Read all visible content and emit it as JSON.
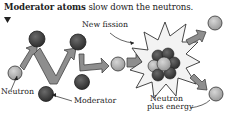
{
  "caption": {
    "bold": "Moderator atoms",
    "rest": " slow down the neutrons."
  },
  "labels": {
    "new_fission": "New fission",
    "neutron": "Neutron",
    "moderator": "Moderator",
    "neutron_plus_energy_1": "Neutron",
    "neutron_plus_energy_2": "plus energy"
  },
  "colors": {
    "neutron": "#b5b5b5",
    "moderator": "#4a4a4a",
    "arrow": "#8e8e8e",
    "burst": "#f2f2f2",
    "outline": "#333333"
  }
}
